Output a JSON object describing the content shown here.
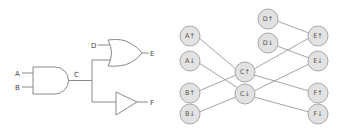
{
  "circuit": {
    "labels": {
      "a": "A",
      "b": "B",
      "c": "C",
      "d": "D",
      "e": "E",
      "f": "F"
    },
    "gates": [
      "AND",
      "OR",
      "BUFFER"
    ]
  },
  "graph": {
    "nodes": {
      "a_up": "A↑",
      "a_down": "A↓",
      "b_up": "B↑",
      "b_down": "B↓",
      "c_up": "C↑",
      "c_down": "C↓",
      "d_up": "D↑",
      "d_down": "D↓",
      "e_up": "E↑",
      "e_down": "E↓",
      "f_up": "F↑",
      "f_down": "F↓"
    },
    "edges": [
      [
        "A↑",
        "C↑"
      ],
      [
        "A↓",
        "C↓"
      ],
      [
        "B↑",
        "C↑"
      ],
      [
        "B↓",
        "C↓"
      ],
      [
        "C↑",
        "E↑"
      ],
      [
        "C↑",
        "F↑"
      ],
      [
        "C↓",
        "E↓"
      ],
      [
        "C↓",
        "F↓"
      ],
      [
        "D↑",
        "E↑"
      ],
      [
        "D↓",
        "E↓"
      ]
    ]
  },
  "colors": {
    "node_fill": "#e2e2e2",
    "node_stroke": "#a8a8a8",
    "line": "#8a8a8a"
  }
}
